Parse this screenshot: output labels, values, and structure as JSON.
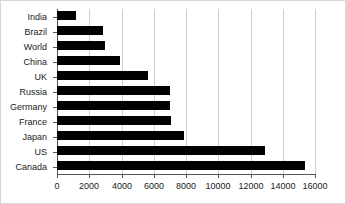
{
  "chart_data": {
    "type": "bar",
    "orientation": "horizontal",
    "title": "",
    "subtitle": "",
    "xlabel": "",
    "ylabel": "",
    "categories": [
      "India",
      "Brazil",
      "World",
      "China",
      "UK",
      "Russia",
      "Germany",
      "France",
      "Japan",
      "US",
      "Canada"
    ],
    "values": [
      1150,
      2850,
      3000,
      3900,
      5650,
      7000,
      7000,
      7100,
      7900,
      12900,
      15400
    ],
    "series": [
      {
        "name": "",
        "values": [
          1150,
          2850,
          3000,
          3900,
          5650,
          7000,
          7000,
          7100,
          7900,
          12900,
          15400
        ]
      }
    ],
    "xlim": [
      0,
      16000
    ],
    "xticks": [
      0,
      2000,
      4000,
      6000,
      8000,
      10000,
      12000,
      14000,
      16000
    ],
    "xtick_labels": [
      "0",
      "2000",
      "4000",
      "6000",
      "8000",
      "10000",
      "12000",
      "14000",
      "16000"
    ],
    "grid": true,
    "grid_axis": "x",
    "legend": false,
    "legend_position": "none",
    "bar_color": "#000000",
    "grid_color": "#cfcfcf",
    "axis_color": "#555555",
    "background_color": "#ffffff"
  }
}
